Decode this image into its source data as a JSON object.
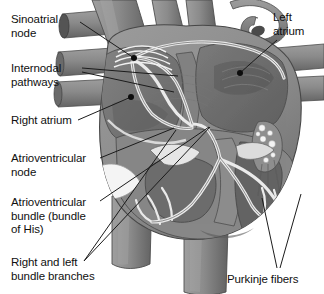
{
  "figure": {
    "width": 324,
    "height": 294,
    "background_color": "#ffffff",
    "style": "grayscale medical illustration, coronal cutaway of the heart"
  },
  "palette": {
    "background": "#ffffff",
    "text": "#101010",
    "leader_line": "#1a1a1a",
    "myocardium_mid": "#8d8d8d",
    "myocardium_dark": "#6f6f6f",
    "myocardium_darkest": "#585858",
    "chamber_shadow": "#767676",
    "vessel_gray": "#7f7f7f",
    "vessel_light": "#9a9a9a",
    "conduction_pathway": "#e8e8e8",
    "conduction_outline": "#5c5c5c",
    "valve_white": "#f2f2f2",
    "node_dot": "#0d0d0d"
  },
  "labels": {
    "sinoatrial_node": "Sinoatrial\nnode",
    "internodal_pathways": "Internodal\npathways",
    "right_atrium": "Right atrium",
    "atrioventricular_node": "Atrioventricular\nnode",
    "atrioventricular_bundle": "Atrioventricular\nbundle (bundle\nof His)",
    "bundle_branches": "Right and left\nbundle branches",
    "left_atrium": "Left\natrium",
    "purkinje_fibers": "Purkinje fibers"
  },
  "annotations": [
    {
      "id": "sinoatrial-node",
      "text": "Sinoatrial node",
      "label_position": {
        "x": 11,
        "y": 13
      },
      "leader_from": {
        "x": 80,
        "y": 22
      },
      "leader_to": {
        "x": 134,
        "y": 58
      },
      "marker": {
        "type": "dot",
        "x": 134,
        "y": 58
      },
      "side": "left"
    },
    {
      "id": "internodal-pathways",
      "text": "Internodal pathways",
      "label_position": {
        "x": 11,
        "y": 62
      },
      "leader_from": {
        "x": 82,
        "y": 68
      },
      "leader_to": {
        "x": 175,
        "y": 78
      },
      "marker": {
        "type": "none"
      },
      "side": "left"
    },
    {
      "id": "internodal-pathways-2",
      "text": "Internodal pathways",
      "label_position": {
        "x": 11,
        "y": 62
      },
      "leader_from": {
        "x": 82,
        "y": 72
      },
      "leader_to": {
        "x": 172,
        "y": 90
      },
      "marker": {
        "type": "none"
      },
      "side": "left"
    },
    {
      "id": "right-atrium",
      "text": "Right atrium",
      "label_position": {
        "x": 11,
        "y": 114
      },
      "leader_from": {
        "x": 78,
        "y": 120
      },
      "leader_to": {
        "x": 131,
        "y": 97
      },
      "marker": {
        "type": "dot",
        "x": 131,
        "y": 97
      },
      "side": "left"
    },
    {
      "id": "atrioventricular-node",
      "text": "Atrioventricular node",
      "label_position": {
        "x": 11,
        "y": 152
      },
      "leader_from": {
        "x": 100,
        "y": 158
      },
      "leader_to": {
        "x": 172,
        "y": 130
      },
      "marker": {
        "type": "none"
      },
      "side": "left"
    },
    {
      "id": "atrioventricular-bundle",
      "text": "Atrioventricular bundle (bundle of His)",
      "label_position": {
        "x": 11,
        "y": 196
      },
      "leader_from": {
        "x": 100,
        "y": 200
      },
      "leader_to": {
        "x": 208,
        "y": 128
      },
      "marker": {
        "type": "none"
      },
      "side": "left"
    },
    {
      "id": "bundle-branches",
      "text": "Right and left bundle branches",
      "label_position": {
        "x": 11,
        "y": 256
      },
      "leader_from": {
        "x": 84,
        "y": 262
      },
      "leader_to": {
        "x": 212,
        "y": 128
      },
      "marker": {
        "type": "none"
      },
      "side": "left"
    },
    {
      "id": "left-atrium",
      "text": "Left atrium",
      "label_position": {
        "x": 273,
        "y": 11
      },
      "leader_from": {
        "x": 276,
        "y": 40
      },
      "leader_to": {
        "x": 240,
        "y": 73
      },
      "marker": {
        "type": "dot",
        "x": 240,
        "y": 73
      },
      "side": "right"
    },
    {
      "id": "purkinje-fibers",
      "text": "Purkinje fibers",
      "label_position": {
        "x": 227,
        "y": 273
      },
      "leader_from": {
        "x": 278,
        "y": 268
      },
      "leader_to": {
        "x": 263,
        "y": 200
      },
      "marker": {
        "type": "none"
      },
      "side": "right"
    },
    {
      "id": "purkinje-fibers-2",
      "text": "Purkinje fibers",
      "label_position": {
        "x": 227,
        "y": 273
      },
      "leader_from": {
        "x": 280,
        "y": 268
      },
      "leader_to": {
        "x": 300,
        "y": 196
      },
      "marker": {
        "type": "none"
      },
      "side": "right"
    }
  ],
  "structures": [
    {
      "name": "superior-vena-cava",
      "kind": "vessel"
    },
    {
      "name": "aorta",
      "kind": "vessel"
    },
    {
      "name": "pulmonary-artery",
      "kind": "vessel"
    },
    {
      "name": "pulmonary-veins",
      "kind": "vessel"
    },
    {
      "name": "inferior-vena-cava",
      "kind": "vessel"
    },
    {
      "name": "right-atrium-chamber",
      "kind": "chamber"
    },
    {
      "name": "left-atrium-chamber",
      "kind": "chamber"
    },
    {
      "name": "right-ventricle-chamber",
      "kind": "chamber"
    },
    {
      "name": "left-ventricle-chamber",
      "kind": "chamber"
    },
    {
      "name": "interventricular-septum",
      "kind": "muscle"
    },
    {
      "name": "papillary-muscle",
      "kind": "muscle"
    },
    {
      "name": "chordae-tendineae",
      "kind": "valve"
    },
    {
      "name": "tricuspid-valve",
      "kind": "valve"
    },
    {
      "name": "mitral-valve",
      "kind": "valve"
    }
  ]
}
